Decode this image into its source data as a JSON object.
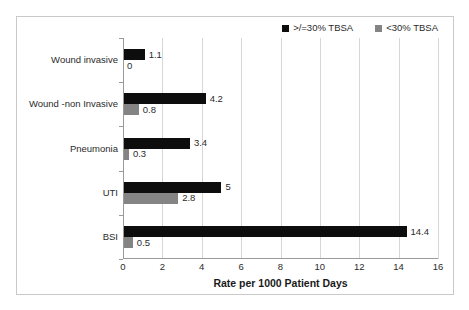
{
  "chart_data": {
    "type": "bar",
    "orientation": "horizontal",
    "title": "",
    "subtitle": "",
    "xlabel": "Rate per 1000 Patient Days",
    "ylabel": "",
    "xlim": [
      0,
      16
    ],
    "xticks": [
      0,
      2,
      4,
      6,
      8,
      10,
      12,
      14,
      16
    ],
    "xtick_labels": [
      "0",
      "2",
      "4",
      "6",
      "8",
      "10",
      "12",
      "14",
      "16"
    ],
    "grid": true,
    "grid_axis": "x",
    "legend_position": "top-right",
    "categories": [
      "Wound invasive",
      "Wound -non Invasive",
      "Pneumonia",
      "UTI",
      "BSI"
    ],
    "series": [
      {
        "name": ">/=30% TBSA",
        "color": "#0d0d0d",
        "values": [
          1.1,
          4.2,
          3.4,
          5,
          14.4
        ],
        "value_labels": [
          "1.1",
          "4.2",
          "3.4",
          "5",
          "14.4"
        ]
      },
      {
        "name": "<30% TBSA",
        "color": "#848484",
        "values": [
          0,
          0.8,
          0.3,
          2.8,
          0.5
        ],
        "value_labels": [
          "0",
          "0.8",
          "0.3",
          "2.8",
          "0.5"
        ]
      }
    ]
  },
  "legend": {
    "items": [
      {
        "label": ">/=30% TBSA",
        "color": "#0d0d0d"
      },
      {
        "label": "<30% TBSA",
        "color": "#848484"
      }
    ]
  },
  "colors": {
    "series_dark": "#0d0d0d",
    "series_gray": "#848484",
    "gridline": "#d6d6d6",
    "axis": "#9a9a9a",
    "frame_border": "#c9c9c9",
    "text": "#2b2b2b",
    "background": "#ffffff"
  }
}
